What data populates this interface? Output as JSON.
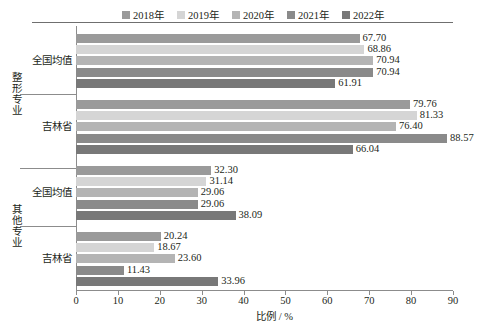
{
  "chart_data": {
    "type": "bar",
    "orientation": "horizontal",
    "title": "",
    "xlabel": "比例 / %",
    "ylabel": "",
    "xlim": [
      0,
      90
    ],
    "xticks": [
      0,
      10,
      20,
      30,
      40,
      50,
      60,
      70,
      80,
      90
    ],
    "grid": false,
    "legend_position": "top",
    "categories": [
      "全国均值",
      "吉林省",
      "全国均值",
      "吉林省"
    ],
    "group_labels": [
      "整形专业",
      "其他专业"
    ],
    "groups": [
      {
        "group_label": "整形专业",
        "rows": [
          {
            "category": "全国均值",
            "values": [
              67.7,
              68.86,
              70.94,
              70.94,
              61.91
            ],
            "labels": [
              "67.70",
              "68.86",
              "70.94",
              "70.94",
              "61.91"
            ]
          },
          {
            "category": "吉林省",
            "values": [
              79.76,
              81.33,
              76.4,
              88.57,
              66.04
            ],
            "labels": [
              "79.76",
              "81.33",
              "76.40",
              "88.57",
              "66.04"
            ]
          }
        ]
      },
      {
        "group_label": "其他专业",
        "rows": [
          {
            "category": "全国均值",
            "values": [
              32.3,
              31.14,
              29.06,
              29.06,
              38.09
            ],
            "labels": [
              "32.30",
              "31.14",
              "29.06",
              "29.06",
              "38.09"
            ]
          },
          {
            "category": "吉林省",
            "values": [
              20.24,
              18.67,
              23.6,
              11.43,
              33.96
            ],
            "labels": [
              "20.24",
              "18.67",
              "23.60",
              "11.43",
              "33.96"
            ]
          }
        ]
      }
    ],
    "series": [
      {
        "name": "2018年",
        "color": "#9a9a9a",
        "values": [
          67.7,
          79.76,
          32.3,
          20.24
        ]
      },
      {
        "name": "2019年",
        "color": "#d5d5d5",
        "values": [
          68.86,
          81.33,
          31.14,
          18.67
        ]
      },
      {
        "name": "2020年",
        "color": "#b4b4b4",
        "values": [
          70.94,
          76.4,
          29.06,
          23.6
        ]
      },
      {
        "name": "2021年",
        "color": "#8a8a8a",
        "values": [
          70.94,
          88.57,
          29.06,
          11.43
        ]
      },
      {
        "name": "2022年",
        "color": "#787878",
        "values": [
          61.91,
          66.04,
          38.09,
          33.96
        ]
      }
    ]
  },
  "legend": {
    "items": [
      {
        "label": "2018年",
        "color": "#9a9a9a"
      },
      {
        "label": "2019年",
        "color": "#d5d5d5"
      },
      {
        "label": "2020年",
        "color": "#b4b4b4"
      },
      {
        "label": "2021年",
        "color": "#8a8a8a"
      },
      {
        "label": "2022年",
        "color": "#787878"
      }
    ]
  },
  "axis": {
    "x_title": "比例 / %",
    "x_ticks": [
      "0",
      "10",
      "20",
      "30",
      "40",
      "50",
      "60",
      "70",
      "80",
      "90"
    ]
  }
}
